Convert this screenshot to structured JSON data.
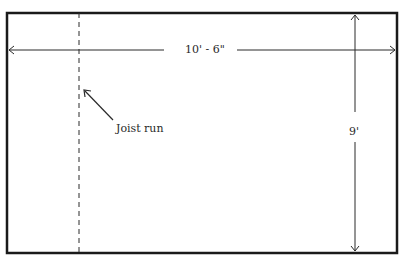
{
  "diagram": {
    "type": "floor-plan-dimension-sketch",
    "labels": {
      "width_dimension": "10' - 6\"",
      "height_dimension": "9'",
      "joist_annotation": "Joist run"
    },
    "colors": {
      "outline": "#1a1a1a",
      "dimension_line": "#2a2a2a",
      "background": "#ffffff"
    },
    "elements": [
      {
        "name": "room-outline",
        "kind": "rectangle"
      },
      {
        "name": "width-dimension-line",
        "kind": "double-arrow",
        "label_ref": "width_dimension"
      },
      {
        "name": "height-dimension-line",
        "kind": "double-arrow",
        "label_ref": "height_dimension"
      },
      {
        "name": "joist-run-line",
        "kind": "dashed-line"
      },
      {
        "name": "joist-pointer-arrow",
        "kind": "arrow",
        "label_ref": "joist_annotation"
      }
    ]
  }
}
